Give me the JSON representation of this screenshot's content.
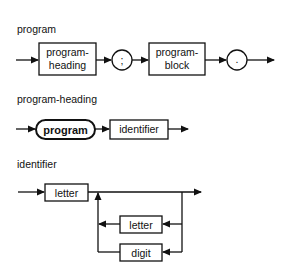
{
  "diagrams": [
    {
      "title": "program",
      "elements": [
        {
          "type": "nonterminal",
          "label_line1": "program-",
          "label_line2": "heading"
        },
        {
          "type": "terminal-circle",
          "label": ";"
        },
        {
          "type": "nonterminal",
          "label_line1": "program-",
          "label_line2": "block"
        },
        {
          "type": "terminal-circle",
          "label": "."
        }
      ]
    },
    {
      "title": "program-heading",
      "elements": [
        {
          "type": "keyword",
          "label": "program"
        },
        {
          "type": "nonterminal",
          "label": "identifier"
        }
      ]
    },
    {
      "title": "identifier",
      "elements": [
        {
          "type": "nonterminal",
          "label": "letter"
        },
        {
          "type": "loop-nonterminal",
          "label": "letter"
        },
        {
          "type": "loop-nonterminal",
          "label": "digit"
        }
      ]
    }
  ],
  "colors": {
    "stroke": "#111111",
    "background": "#ffffff"
  }
}
